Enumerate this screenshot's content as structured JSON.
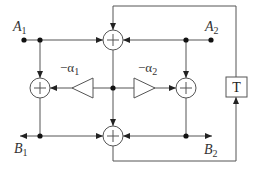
{
  "diagram": {
    "type": "signal-flow / lattice structure",
    "inputs": [
      {
        "id": "A1",
        "label": "A",
        "sub": "1"
      },
      {
        "id": "A2",
        "label": "A",
        "sub": "2"
      }
    ],
    "outputs": [
      {
        "id": "B1",
        "label": "B",
        "sub": "1"
      },
      {
        "id": "B2",
        "label": "B",
        "sub": "2"
      }
    ],
    "multipliers": [
      {
        "id": "m1",
        "label": "−α",
        "sub": "1",
        "direction": "left"
      },
      {
        "id": "m2",
        "label": "−α",
        "sub": "2",
        "direction": "right"
      }
    ],
    "adders": [
      {
        "id": "top",
        "symbol": "+"
      },
      {
        "id": "left",
        "symbol": "+"
      },
      {
        "id": "right",
        "symbol": "+"
      },
      {
        "id": "bottom",
        "symbol": "+"
      }
    ],
    "delay": {
      "label": "T"
    },
    "colors": {
      "line": "#555555",
      "dot": "#111111",
      "text": "#333333"
    }
  }
}
